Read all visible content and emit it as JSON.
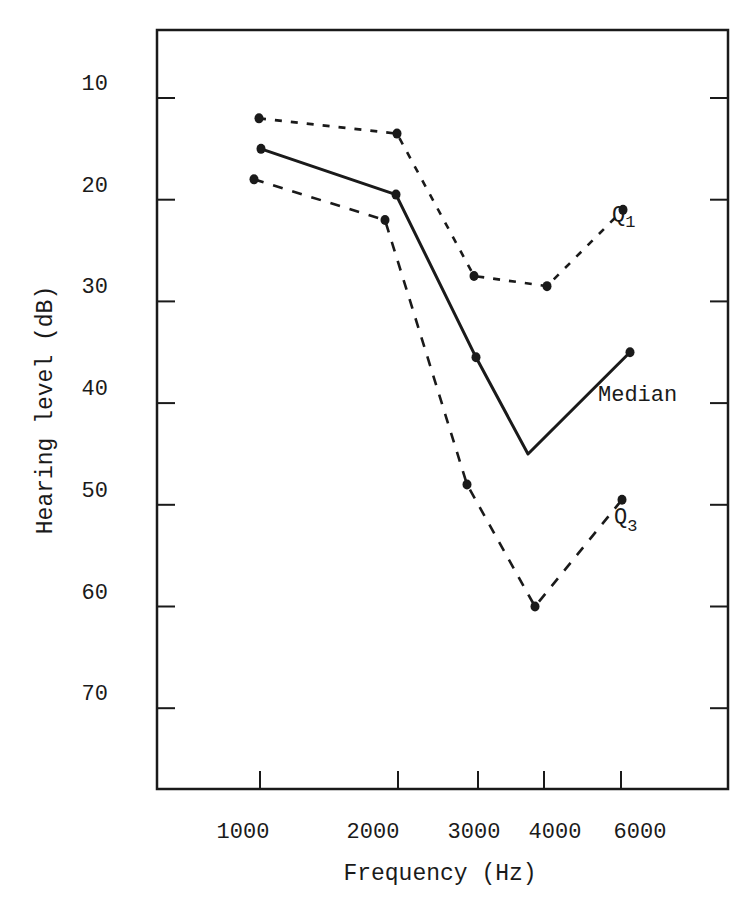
{
  "chart_data": {
    "type": "line",
    "title": "",
    "xlabel": "Frequency (Hz)",
    "ylabel": "Hearing level (dB)",
    "x_ticks": [
      "1000",
      "2000",
      "3000",
      "4000",
      "6000"
    ],
    "y_ticks": [
      10,
      20,
      30,
      40,
      50,
      60,
      70
    ],
    "ylim": [
      3,
      78
    ],
    "y_inverted": true,
    "grid": false,
    "legend": "inline labels",
    "series": [
      {
        "name": "Q1",
        "label_main": "Q",
        "label_sub": "1",
        "style": "short-dash",
        "points": [
          {
            "x": "1000",
            "y": 12
          },
          {
            "x": "2000",
            "y": 13.5
          },
          {
            "x": "3000",
            "y": 27.5
          },
          {
            "x": "4000",
            "y": 28.5
          },
          {
            "x": "6000",
            "y": 21
          }
        ]
      },
      {
        "name": "Median",
        "label_main": "Median",
        "label_sub": "",
        "style": "solid",
        "points": [
          {
            "x": "1000",
            "y": 15
          },
          {
            "x": "2000",
            "y": 19.5
          },
          {
            "x": "3000",
            "y": 35.5
          },
          {
            "x": "3500",
            "y": 45
          },
          {
            "x": "6000",
            "y": 35
          }
        ]
      },
      {
        "name": "Q3",
        "label_main": "Q",
        "label_sub": "3",
        "style": "long-dash",
        "points": [
          {
            "x": "1000",
            "y": 18
          },
          {
            "x": "2000",
            "y": 22
          },
          {
            "x": "3000",
            "y": 48
          },
          {
            "x": "4000",
            "y": 60
          },
          {
            "x": "6000",
            "y": 49.5
          }
        ]
      }
    ]
  },
  "axis": {
    "y_labels": [
      "10",
      "20",
      "30",
      "40",
      "50",
      "60",
      "70"
    ],
    "x_labels": [
      "1000",
      "2000",
      "3000",
      "4000",
      "6000"
    ]
  }
}
